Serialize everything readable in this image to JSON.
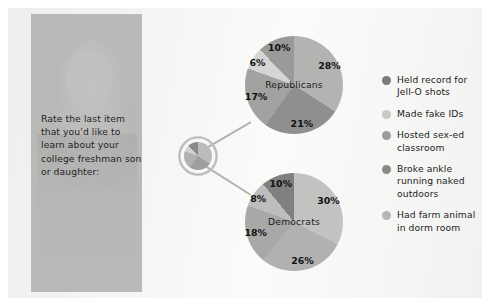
{
  "question": {
    "text": "Rate the last item that you'd like to learn about your college freshman son or daughter:"
  },
  "chart_data": {
    "type": "pie",
    "title": "Rate the last item that you'd like to learn about your college freshman son or daughter:",
    "legend_position": "right",
    "categories": [
      "Held record for Jell-O shots",
      "Made fake IDs",
      "Hosted sex-ed classroom",
      "Broke ankle running naked outdoors",
      "Had farm animal in dorm room"
    ],
    "category_colors": [
      "#7b7b7a",
      "#c9c9c8",
      "#9b9b9a",
      "#8a8a89",
      "#b6b6b5"
    ],
    "charts": [
      {
        "name": "Republicans",
        "label": "Republicans",
        "labels": [
          "28%",
          "21%",
          "17%",
          "6%",
          "10%"
        ],
        "values": [
          28,
          21,
          17,
          6,
          10
        ],
        "slice_colors": [
          "#b3b3b2",
          "#8f8f8e",
          "#a2a2a1",
          "#d5d5d4",
          "#9a9a99"
        ]
      },
      {
        "name": "Democrats",
        "label": "Democrats",
        "labels": [
          "30%",
          "26%",
          "18%",
          "8%",
          "10%"
        ],
        "values": [
          30,
          26,
          18,
          8,
          10
        ],
        "slice_colors": [
          "#c2c2c1",
          "#b1b1b0",
          "#a8a8a7",
          "#bdbdbc",
          "#808080"
        ]
      }
    ]
  },
  "legend": {
    "items": [
      {
        "label": "Held record for Jell-O shots",
        "color": "#7b7b7a"
      },
      {
        "label": "Made fake IDs",
        "color": "#c9c9c8"
      },
      {
        "label": "Hosted sex-ed classroom",
        "color": "#9b9b9a"
      },
      {
        "label": "Broke ankle running naked outdoors",
        "color": "#8a8a89"
      },
      {
        "label": "Had farm animal in dorm room",
        "color": "#b6b6b5"
      }
    ]
  },
  "republicans": {
    "label": "Republicans",
    "slices": [
      {
        "label": "28%",
        "value": 28,
        "color": "#b3b3b2"
      },
      {
        "label": "21%",
        "value": 21,
        "color": "#8f8f8e"
      },
      {
        "label": "17%",
        "value": 17,
        "color": "#a2a2a1"
      },
      {
        "label": "6%",
        "value": 6,
        "color": "#d5d5d4"
      },
      {
        "label": "10%",
        "value": 10,
        "color": "#9a9a99"
      }
    ]
  },
  "democrats": {
    "label": "Democrats",
    "slices": [
      {
        "label": "30%",
        "value": 30,
        "color": "#c2c2c1"
      },
      {
        "label": "26%",
        "value": 26,
        "color": "#b1b1b0"
      },
      {
        "label": "18%",
        "value": 18,
        "color": "#a8a8a7"
      },
      {
        "label": "8%",
        "value": 8,
        "color": "#bdbdbc"
      },
      {
        "label": "10%",
        "value": 10,
        "color": "#808080"
      }
    ]
  },
  "hub": {
    "slices": [
      {
        "value": 28,
        "color": "#bcbcbb"
      },
      {
        "value": 21,
        "color": "#9f9f9e"
      },
      {
        "value": 17,
        "color": "#b0b0af"
      },
      {
        "value": 6,
        "color": "#d2d2d1"
      },
      {
        "value": 10,
        "color": "#8a8a89"
      }
    ],
    "ring_color": "#bdbdbc"
  }
}
